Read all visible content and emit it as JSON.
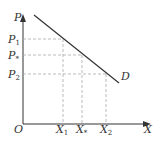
{
  "diagram": {
    "type": "demand-curve",
    "axes": {
      "y_label": "P",
      "x_label": "X",
      "origin_label": "O"
    },
    "curve": {
      "label": "D",
      "color": "#333333"
    },
    "price_levels": [
      {
        "label": "P",
        "sub": "1"
      },
      {
        "label": "P",
        "sub": "*"
      },
      {
        "label": "P",
        "sub": "2"
      }
    ],
    "quantity_levels": [
      {
        "label": "X",
        "sub": "1"
      },
      {
        "label": "X",
        "sub": "*"
      },
      {
        "label": "X",
        "sub": "2"
      }
    ],
    "guide_line_color": "#aaaaaa"
  }
}
